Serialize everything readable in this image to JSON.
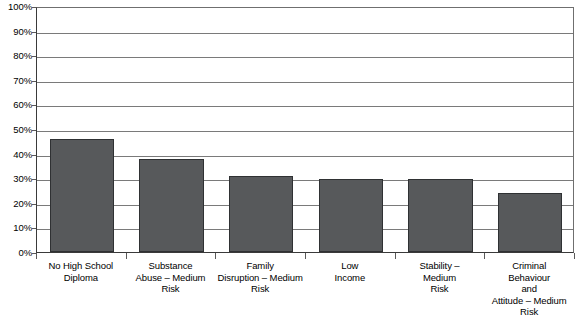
{
  "chart_data": {
    "type": "bar",
    "title": "",
    "subtitle": "",
    "xlabel": "",
    "ylabel": "",
    "ylim": [
      0,
      100
    ],
    "y_unit": "%",
    "grid": true,
    "legend": "none",
    "orientation": "vertical",
    "bar_color": "#57595B",
    "bar_border_color": "#2F3133",
    "gridline_color": "#7A7A7A",
    "axis_color": "#3A3A3A",
    "categories": [
      "No High School Diploma",
      "Substance Abuse – Medium Risk",
      "Family Disruption – Medium Risk",
      "Low Income",
      "Stability – Medium Risk",
      "Criminal Behaviour and Attitude – Medium Risk"
    ],
    "category_lines": [
      [
        "No High School",
        "Diploma"
      ],
      [
        "Substance",
        "Abuse – Medium",
        "Risk"
      ],
      [
        "Family",
        "Disruption – Medium",
        "Risk"
      ],
      [
        "Low",
        "Income"
      ],
      [
        "Stability –",
        "Medium",
        "Risk"
      ],
      [
        "Criminal",
        "Behaviour",
        "and",
        "Attitude – Medium",
        "Risk"
      ]
    ],
    "values": [
      46,
      38,
      31,
      29.5,
      29.5,
      24
    ],
    "yticks": [
      0,
      10,
      20,
      30,
      40,
      50,
      60,
      70,
      80,
      90,
      100
    ],
    "ytick_labels": [
      "0%",
      "10%",
      "20%",
      "30%",
      "40%",
      "50%",
      "60%",
      "70%",
      "80%",
      "90%",
      "100%"
    ]
  }
}
